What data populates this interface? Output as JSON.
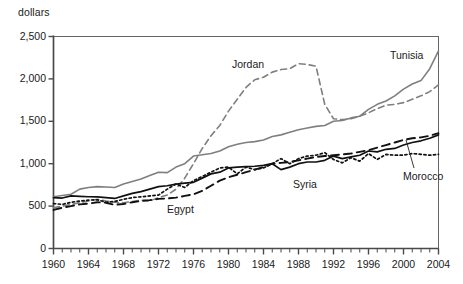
{
  "chart_data": {
    "type": "line",
    "title": "",
    "subtitle": "",
    "xlabel": "",
    "ylabel": "dollars",
    "ylim": [
      0,
      2500
    ],
    "xlim": [
      1960,
      2004
    ],
    "yticks": [
      "0",
      "500",
      "1,000",
      "1,500",
      "2,000",
      "2,500"
    ],
    "ytick_values": [
      0,
      500,
      1000,
      1500,
      2000,
      2500
    ],
    "xticks": [
      "1960",
      "1964",
      "1968",
      "1972",
      "1976",
      "1980",
      "1984",
      "1988",
      "1992",
      "1996",
      "2000",
      "2004"
    ],
    "xtick_values": [
      1960,
      1964,
      1968,
      1972,
      1976,
      1980,
      1984,
      1988,
      1992,
      1996,
      2000,
      2004
    ],
    "xtick_minor_step": 1,
    "grid": false,
    "legend_position": "inline-annotations",
    "x": [
      1960,
      1961,
      1962,
      1963,
      1964,
      1965,
      1966,
      1967,
      1968,
      1969,
      1970,
      1971,
      1972,
      1973,
      1974,
      1975,
      1976,
      1977,
      1978,
      1979,
      1980,
      1981,
      1982,
      1983,
      1984,
      1985,
      1986,
      1987,
      1988,
      1989,
      1990,
      1991,
      1992,
      1993,
      1994,
      1995,
      1996,
      1997,
      1998,
      1999,
      2000,
      2001,
      2002,
      2003,
      2004
    ],
    "series": [
      {
        "name": "Tunisia",
        "style": "solid-gray",
        "color": "#7f7f7f",
        "values": [
          610,
          625,
          640,
          700,
          720,
          730,
          725,
          720,
          760,
          790,
          820,
          860,
          900,
          895,
          960,
          1000,
          1090,
          1105,
          1120,
          1150,
          1200,
          1230,
          1250,
          1260,
          1280,
          1320,
          1340,
          1370,
          1400,
          1420,
          1440,
          1450,
          1500,
          1510,
          1540,
          1560,
          1640,
          1700,
          1740,
          1800,
          1880,
          1940,
          1980,
          2120,
          2330
        ]
      },
      {
        "name": "Jordan",
        "style": "dashed-gray",
        "color": "#7f7f7f",
        "values": [
          480,
          500,
          520,
          540,
          560,
          580,
          560,
          545,
          540,
          555,
          570,
          560,
          600,
          630,
          700,
          830,
          1000,
          1180,
          1330,
          1450,
          1620,
          1760,
          1900,
          1990,
          2020,
          2080,
          2110,
          2120,
          2180,
          2170,
          2150,
          1700,
          1530,
          1520,
          1530,
          1560,
          1600,
          1650,
          1690,
          1700,
          1720,
          1760,
          1800,
          1850,
          1930
        ]
      },
      {
        "name": "Egypt",
        "style": "dashed-black",
        "color": "#111111",
        "values": [
          455,
          480,
          500,
          520,
          530,
          545,
          540,
          515,
          525,
          545,
          560,
          570,
          585,
          590,
          600,
          620,
          640,
          680,
          740,
          800,
          840,
          870,
          900,
          930,
          960,
          1000,
          1010,
          1020,
          1040,
          1060,
          1080,
          1090,
          1100,
          1110,
          1120,
          1140,
          1160,
          1190,
          1220,
          1250,
          1280,
          1300,
          1310,
          1330,
          1360
        ]
      },
      {
        "name": "Syria",
        "style": "solid-black",
        "color": "#111111",
        "values": [
          600,
          595,
          620,
          615,
          610,
          608,
          600,
          590,
          620,
          650,
          670,
          700,
          730,
          740,
          760,
          770,
          780,
          830,
          880,
          900,
          950,
          960,
          965,
          970,
          980,
          1000,
          930,
          960,
          1000,
          1020,
          1020,
          1040,
          1090,
          1060,
          1080,
          1100,
          1150,
          1140,
          1170,
          1180,
          1220,
          1250,
          1270,
          1300,
          1340
        ]
      },
      {
        "name": "Morocco",
        "style": "dotted-black",
        "color": "#111111",
        "values": [
          530,
          520,
          545,
          560,
          570,
          575,
          545,
          555,
          580,
          600,
          610,
          620,
          630,
          700,
          760,
          720,
          800,
          850,
          900,
          950,
          960,
          880,
          960,
          930,
          950,
          1000,
          1060,
          1000,
          1060,
          1090,
          1100,
          1130,
          1050,
          1010,
          1070,
          1030,
          1120,
          1050,
          1110,
          1100,
          1100,
          1120,
          1110,
          1100,
          1110
        ]
      }
    ],
    "annotations": [
      {
        "label": "Jordan",
        "x": 232,
        "y": 58
      },
      {
        "label": "Tunisia",
        "x": 390,
        "y": 49
      },
      {
        "label": "Egypt",
        "x": 167,
        "y": 203
      },
      {
        "label": "Syria",
        "x": 293,
        "y": 178
      },
      {
        "label": "Morocco",
        "x": 403,
        "y": 170
      }
    ]
  }
}
